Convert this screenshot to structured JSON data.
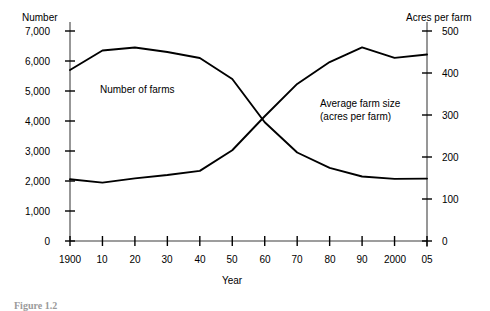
{
  "figure": {
    "caption": "Figure 1.2"
  },
  "chart_data": {
    "type": "line",
    "title": "",
    "xlabel": "Year",
    "grid": false,
    "legend": "inline-annotations",
    "x": [
      1900,
      1910,
      1920,
      1930,
      1940,
      1950,
      1960,
      1970,
      1980,
      1990,
      2000,
      2005
    ],
    "x_tick_labels": [
      "1900",
      "10",
      "20",
      "30",
      "40",
      "50",
      "60",
      "70",
      "80",
      "90",
      "2000",
      "05"
    ],
    "axes": {
      "left": {
        "name": "Number",
        "ylim": [
          0,
          7000
        ],
        "ticks": [
          0,
          1000,
          2000,
          3000,
          4000,
          5000,
          6000,
          7000
        ],
        "tick_labels": [
          "0",
          "1,000",
          "2,000",
          "3,000",
          "4,000",
          "5,000",
          "6,000",
          "7,000"
        ]
      },
      "right": {
        "name": "Acres per farm",
        "ylim": [
          0,
          500
        ],
        "ticks": [
          0,
          100,
          200,
          300,
          400,
          500
        ],
        "tick_labels": [
          "0",
          "100",
          "200",
          "300",
          "400",
          "500"
        ]
      }
    },
    "series": [
      {
        "name": "Number of farms",
        "label": "Number of farms",
        "axis": "left",
        "units": "thousands of farms",
        "color": "#000000",
        "values": [
          5700,
          6350,
          6450,
          6300,
          6100,
          5400,
          3960,
          2950,
          2440,
          2150,
          2070,
          2080
        ]
      },
      {
        "name": "Average farm size",
        "label": "Average farm size\n(acres per farm)",
        "label_line1": "Average farm size",
        "label_line2": "(acres per farm)",
        "axis": "right",
        "units": "acres per farm",
        "color": "#000000",
        "values": [
          147,
          139,
          149,
          157,
          167,
          216,
          297,
          374,
          426,
          461,
          436,
          444
        ]
      }
    ],
    "annotations": [
      {
        "text": "Number of farms",
        "x": 1925,
        "axis": "left"
      },
      {
        "text": "Average farm size (acres per farm)",
        "x": 1975,
        "axis": "right"
      }
    ]
  }
}
